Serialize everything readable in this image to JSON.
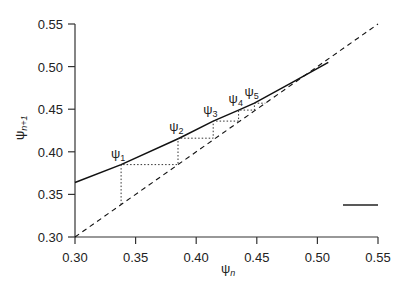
{
  "chart_data": {
    "type": "line",
    "title": "",
    "xlabel": "ψ_n",
    "ylabel": "ψ_n+1",
    "xlim": [
      0.3,
      0.55
    ],
    "ylim": [
      0.3,
      0.55
    ],
    "grid": false,
    "x_ticks": [
      "0.30",
      "0.35",
      "0.40",
      "0.45",
      "0.50",
      "0.55"
    ],
    "y_ticks": [
      "0.30",
      "0.35",
      "0.40",
      "0.45",
      "0.50",
      "0.55"
    ],
    "series": [
      {
        "name": "return map",
        "style": "solid",
        "x": [
          0.3,
          0.338,
          0.386,
          0.414,
          0.435,
          0.448,
          0.48,
          0.509
        ],
        "y": [
          0.364,
          0.385,
          0.416,
          0.436,
          0.449,
          0.457,
          0.482,
          0.505
        ]
      },
      {
        "name": "identity line (ψ_n+1 = ψ_n)",
        "style": "dashed",
        "x": [
          0.3,
          0.55
        ],
        "y": [
          0.3,
          0.55
        ]
      },
      {
        "name": "cobweb iteration",
        "style": "dotted",
        "x": [
          0.338,
          0.338,
          0.385,
          0.385,
          0.414,
          0.414,
          0.435,
          0.435,
          0.448,
          0.448,
          0.457
        ],
        "y": [
          0.338,
          0.385,
          0.385,
          0.416,
          0.416,
          0.436,
          0.436,
          0.449,
          0.449,
          0.457,
          0.457
        ]
      }
    ],
    "annotations": [
      {
        "text": "ψ1",
        "x": 0.338,
        "y": 0.385
      },
      {
        "text": "ψ2",
        "x": 0.386,
        "y": 0.416
      },
      {
        "text": "ψ3",
        "x": 0.414,
        "y": 0.436
      },
      {
        "text": "ψ4",
        "x": 0.435,
        "y": 0.449
      },
      {
        "text": "ψ5",
        "x": 0.448,
        "y": 0.457
      }
    ],
    "legend": {
      "position": "lower right",
      "entries": [
        {
          "style": "solid",
          "label": ""
        }
      ]
    }
  },
  "labels": {
    "psi": "ψ",
    "x_sub": "n",
    "y_sub": "n+1",
    "pts": [
      {
        "main": "ψ",
        "sub": "1"
      },
      {
        "main": "ψ",
        "sub": "2"
      },
      {
        "main": "ψ",
        "sub": "3"
      },
      {
        "main": "ψ",
        "sub": "4"
      },
      {
        "main": "ψ",
        "sub": "5"
      }
    ]
  }
}
